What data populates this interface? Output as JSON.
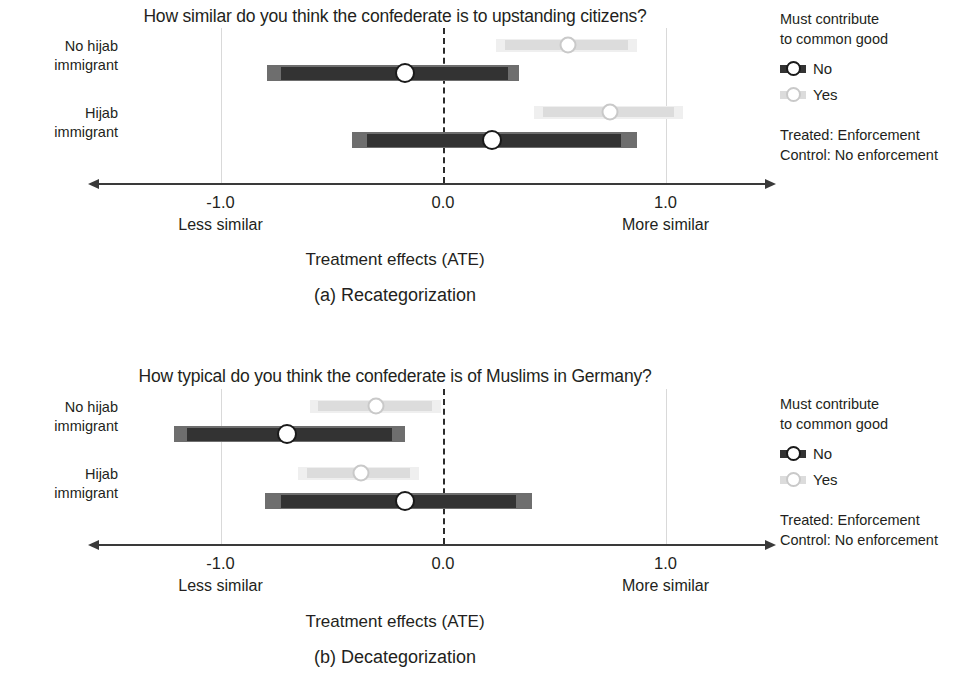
{
  "figure": {
    "width": 980,
    "height": 687,
    "background": "#ffffff"
  },
  "colors": {
    "treated_dark": "#333333",
    "treated_outer": "#6e6e6e",
    "control_light": "#dcdcdc",
    "control_outer": "#efefef",
    "marker_fill": "#ffffff",
    "marker_stroke_dark": "#1a1a1a",
    "marker_stroke_light": "#c9c9c9",
    "axis": "#3a3a3a",
    "gridline": "#d9d9d9",
    "zeroline": "#2b2b2b",
    "text": "#231f20"
  },
  "axis": {
    "ticks": [
      "-1.0",
      "0.0",
      "1.0"
    ],
    "tick_values": [
      -1.0,
      0.0,
      1.0
    ],
    "xlim": [
      -1.55,
      1.45
    ],
    "left_end_label": "Less similar",
    "right_end_label": "More similar",
    "axis_title": "Treatment effects (ATE)"
  },
  "legend": {
    "title_line1": "Must contribute",
    "title_line2": "to common good",
    "entries": [
      {
        "label": "No",
        "style": "dark"
      },
      {
        "label": "Yes",
        "style": "light"
      }
    ],
    "note_line1": "Treated: Enforcement",
    "note_line2": "Control: No enforcement"
  },
  "row_labels": [
    {
      "line1": "No hijab",
      "line2": "immigrant"
    },
    {
      "line1": "Hijab",
      "line2": "immigrant"
    }
  ],
  "panels": [
    {
      "id": "a",
      "title": "How similar do you think the confederate is to upstanding citizens?",
      "caption": "(a) Recategorization",
      "axis_title": "Treatment effects (ATE)"
    },
    {
      "id": "b",
      "title": "How typical do you think the confederate is of Muslims in Germany?",
      "caption": "(b) Decategorization",
      "axis_title": "Treatment effects (ATE)"
    }
  ],
  "chart_data": [
    {
      "type": "scatter",
      "subtype": "coefficient-plot-with-confidence-intervals",
      "panel": "a",
      "title": "How similar do you think the confederate is to upstanding citizens?",
      "caption": "(a) Recategorization",
      "xlabel": "Treatment effects (ATE)",
      "ylabel": "",
      "xlim": [
        -1.55,
        1.45
      ],
      "xticks": [
        -1.0,
        0.0,
        1.0
      ],
      "xticklabels": [
        "-1.0",
        "0.0",
        "1.0"
      ],
      "x_axis_end_labels": [
        "Less similar",
        "More similar"
      ],
      "grid": "vertical gridlines at -1.0 and 1.0; dashed reference line at 0.0",
      "legend": {
        "title": "Must contribute to common good",
        "position": "right",
        "entries": [
          "No",
          "Yes"
        ]
      },
      "categories": [
        "No hijab immigrant",
        "Hijab immigrant"
      ],
      "series": [
        {
          "name": "No",
          "style": "dark",
          "points": [
            {
              "category": "No hijab immigrant",
              "estimate": -0.17,
              "ci_outer": [
                -0.79,
                0.34
              ],
              "ci_inner": [
                -0.73,
                0.29
              ]
            },
            {
              "category": "Hijab immigrant",
              "estimate": 0.22,
              "ci_outer": [
                -0.41,
                0.87
              ],
              "ci_inner": [
                -0.34,
                0.8
              ]
            }
          ]
        },
        {
          "name": "Yes",
          "style": "light",
          "points": [
            {
              "category": "No hijab immigrant",
              "estimate": 0.56,
              "ci_outer": [
                0.24,
                0.87
              ],
              "ci_inner": [
                0.28,
                0.83
              ]
            },
            {
              "category": "Hijab immigrant",
              "estimate": 0.75,
              "ci_outer": [
                0.41,
                1.08
              ],
              "ci_inner": [
                0.45,
                1.04
              ]
            }
          ]
        }
      ]
    },
    {
      "type": "scatter",
      "subtype": "coefficient-plot-with-confidence-intervals",
      "panel": "b",
      "title": "How typical do you think the confederate is of Muslims in Germany?",
      "caption": "(b) Decategorization",
      "xlabel": "Treatment effects (ATE)",
      "ylabel": "",
      "xlim": [
        -1.55,
        1.45
      ],
      "xticks": [
        -1.0,
        0.0,
        1.0
      ],
      "xticklabels": [
        "-1.0",
        "0.0",
        "1.0"
      ],
      "x_axis_end_labels": [
        "Less similar",
        "More similar"
      ],
      "grid": "vertical gridlines at -1.0 and 1.0; dashed reference line at 0.0",
      "legend": {
        "title": "Must contribute to common good",
        "position": "right",
        "entries": [
          "No",
          "Yes"
        ]
      },
      "categories": [
        "No hijab immigrant",
        "Hijab immigrant"
      ],
      "series": [
        {
          "name": "No",
          "style": "dark",
          "points": [
            {
              "category": "No hijab immigrant",
              "estimate": -0.7,
              "ci_outer": [
                -1.21,
                -0.17
              ],
              "ci_inner": [
                -1.15,
                -0.23
              ]
            },
            {
              "category": "Hijab immigrant",
              "estimate": -0.17,
              "ci_outer": [
                -0.8,
                0.4
              ],
              "ci_inner": [
                -0.73,
                0.33
              ]
            }
          ]
        },
        {
          "name": "Yes",
          "style": "light",
          "points": [
            {
              "category": "No hijab immigrant",
              "estimate": -0.3,
              "ci_outer": [
                -0.6,
                -0.01
              ],
              "ci_inner": [
                -0.56,
                -0.05
              ]
            },
            {
              "category": "Hijab immigrant",
              "estimate": -0.37,
              "ci_outer": [
                -0.65,
                -0.11
              ],
              "ci_inner": [
                -0.61,
                -0.15
              ]
            }
          ]
        }
      ]
    }
  ]
}
